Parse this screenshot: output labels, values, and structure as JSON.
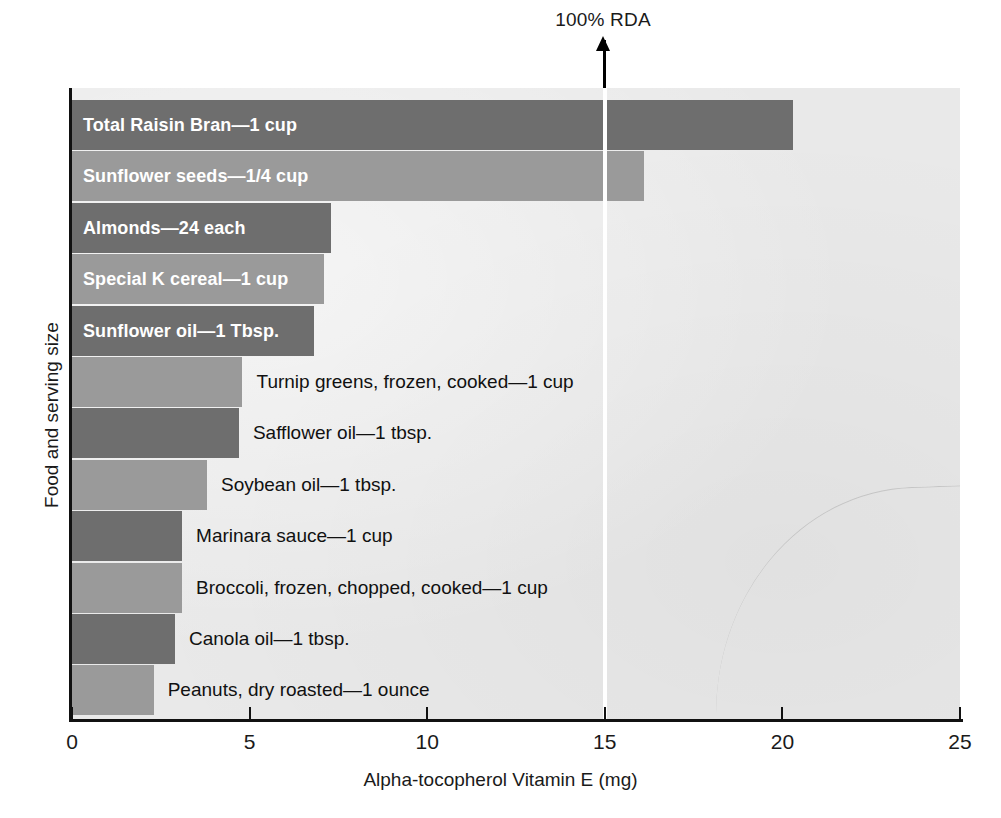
{
  "annotation": {
    "rda_label": "100% RDA",
    "arrow_icon": "up-arrow-icon",
    "rda_value": 15
  },
  "axes": {
    "x_title": "Alpha-tocopherol Vitamin E (mg)",
    "y_title": "Food and serving size",
    "x_ticks": [
      "0",
      "5",
      "10",
      "15",
      "20",
      "25"
    ]
  },
  "chart_data": {
    "type": "bar",
    "orientation": "horizontal",
    "title": "",
    "xlabel": "Alpha-tocopherol Vitamin E (mg)",
    "ylabel": "Food and serving size",
    "xlim": [
      0,
      25
    ],
    "xticks": [
      0,
      5,
      10,
      15,
      20,
      25
    ],
    "grid": false,
    "legend": null,
    "annotations": [
      {
        "label": "100% RDA",
        "x": 15,
        "type": "vertical-line-with-arrow"
      }
    ],
    "categories": [
      "Total Raisin Bran—1 cup",
      "Sunflower seeds—1/4 cup",
      "Almonds—24 each",
      "Special K cereal—1 cup",
      "Sunflower oil—1 Tbsp.",
      "Turnip greens, frozen, cooked—1 cup",
      "Safflower oil—1 tbsp.",
      "Soybean oil—1 tbsp.",
      "Marinara sauce—1 cup",
      "Broccoli, frozen, chopped, cooked—1 cup",
      "Canola oil—1 tbsp.",
      "Peanuts, dry roasted—1 ounce"
    ],
    "values": [
      20.3,
      16.1,
      7.3,
      7.1,
      6.8,
      4.8,
      4.7,
      3.8,
      3.1,
      3.1,
      2.9,
      2.3
    ]
  },
  "bars": [
    {
      "label": "Total Raisin Bran—1 cup",
      "value": 20.3,
      "shade": "dark",
      "label_position": "inside"
    },
    {
      "label": "Sunflower seeds—1/4 cup",
      "value": 16.1,
      "shade": "light",
      "label_position": "inside"
    },
    {
      "label": "Almonds—24 each",
      "value": 7.3,
      "shade": "dark",
      "label_position": "inside"
    },
    {
      "label": "Special K cereal—1 cup",
      "value": 7.1,
      "shade": "light",
      "label_position": "inside"
    },
    {
      "label": "Sunflower oil—1 Tbsp.",
      "value": 6.8,
      "shade": "dark",
      "label_position": "inside"
    },
    {
      "label": "Turnip greens, frozen, cooked—1 cup",
      "value": 4.8,
      "shade": "light",
      "label_position": "outside"
    },
    {
      "label": "Safflower oil—1 tbsp.",
      "value": 4.7,
      "shade": "dark",
      "label_position": "outside"
    },
    {
      "label": "Soybean oil—1 tbsp.",
      "value": 3.8,
      "shade": "light",
      "label_position": "outside"
    },
    {
      "label": "Marinara sauce—1 cup",
      "value": 3.1,
      "shade": "dark",
      "label_position": "outside"
    },
    {
      "label": "Broccoli, frozen, chopped, cooked—1 cup",
      "value": 3.1,
      "shade": "light",
      "label_position": "outside"
    },
    {
      "label": "Canola oil—1 tbsp.",
      "value": 2.9,
      "shade": "dark",
      "label_position": "outside"
    },
    {
      "label": "Peanuts, dry roasted—1 ounce",
      "value": 2.3,
      "shade": "light",
      "label_position": "outside"
    }
  ],
  "colors": {
    "bar_dark": "#6e6e6e",
    "bar_light": "#9a9a9a",
    "plot_background": "#e9e9e9",
    "axis": "#111111",
    "rda_line": "#ffffff",
    "inside_label_text": "#ffffff",
    "outside_label_text": "#111111"
  }
}
